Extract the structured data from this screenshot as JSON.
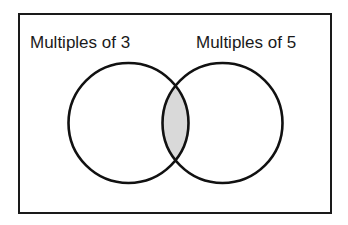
{
  "diagram": {
    "type": "venn",
    "sets": [
      {
        "label": "Multiples of 3",
        "cx": 128.5,
        "cy": 123,
        "r": 60
      },
      {
        "label": "Multiples of 5",
        "cx": 222.5,
        "cy": 123,
        "r": 60
      }
    ],
    "shaded_region": "intersection",
    "colors": {
      "stroke": "#111111",
      "shade": "#d9d9d9",
      "background": "#ffffff"
    }
  }
}
